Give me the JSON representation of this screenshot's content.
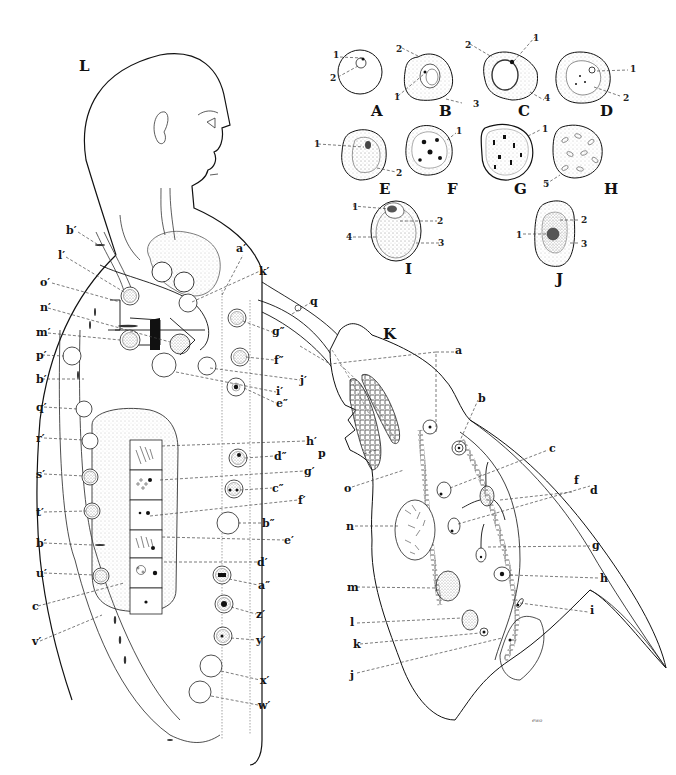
{
  "figure": {
    "panels": {
      "L": "L",
      "K": "K",
      "A": "A",
      "B": "B",
      "C": "C",
      "D": "D",
      "E": "E",
      "F": "F",
      "G": "G",
      "H": "H",
      "I": "I",
      "J": "J"
    },
    "signature": "ewo",
    "colors": {
      "ink": "#111111",
      "stipple": "#9a9a9a",
      "fill_gray": "#e6e6e6",
      "background": "#ffffff"
    }
  },
  "cell_panels": [
    {
      "id": "A",
      "numbered_parts": [
        "1",
        "2"
      ]
    },
    {
      "id": "B",
      "numbered_parts": [
        "1",
        "2",
        "3"
      ]
    },
    {
      "id": "C",
      "numbered_parts": [
        "1",
        "2",
        "4"
      ]
    },
    {
      "id": "D",
      "numbered_parts": [
        "1",
        "2"
      ]
    },
    {
      "id": "E",
      "numbered_parts": [
        "1",
        "2"
      ]
    },
    {
      "id": "F",
      "numbered_parts": [
        "1"
      ]
    },
    {
      "id": "G",
      "numbered_parts": [
        "1"
      ]
    },
    {
      "id": "H",
      "numbered_parts": [
        "5"
      ]
    },
    {
      "id": "I",
      "numbered_parts": [
        "1",
        "2",
        "3",
        "4"
      ]
    },
    {
      "id": "J",
      "numbered_parts": [
        "1",
        "2",
        "3"
      ]
    }
  ],
  "body_labels_left": [
    "b′",
    "l′",
    "o′",
    "n′",
    "m′",
    "p′",
    "b′",
    "q′",
    "r′",
    "s′",
    "t′",
    "b′",
    "u′",
    "c",
    "v′"
  ],
  "body_labels_right": [
    "a′",
    "k′",
    "q",
    "g″",
    "j′",
    "f″",
    "i′",
    "e″",
    "h′",
    "d″",
    "g′",
    "c″",
    "f′",
    "b″",
    "e′",
    "d′",
    "a″",
    "z′",
    "y′",
    "x′",
    "w′"
  ],
  "k_labels": [
    "a",
    "b",
    "c",
    "f",
    "d",
    "g",
    "h",
    "i",
    "p",
    "o",
    "n",
    "m",
    "l",
    "k",
    "j"
  ],
  "labels": {
    "L": "L",
    "K": "K",
    "bp1": "b′",
    "lp": "l′",
    "op": "o′",
    "np": "n′",
    "mp": "m′",
    "pp": "p′",
    "bp2": "b′",
    "qp": "q′",
    "rp": "r′",
    "sp": "s′",
    "tp": "t′",
    "bp3": "b′",
    "up": "u′",
    "c_left": "c",
    "vp": "v′",
    "ap": "a′",
    "kp": "k′",
    "q": "q",
    "gpp": "g″",
    "jp": "j′",
    "fpp": "f″",
    "ip": "i′",
    "epp": "e″",
    "hp": "h′",
    "dpp": "d″",
    "gp": "g′",
    "cpp": "c″",
    "fp": "f′",
    "bpp": "b″",
    "ep": "e′",
    "dp": "d′",
    "app": "a″",
    "zp": "z′",
    "yp": "y′",
    "xp": "x′",
    "wp": "w′",
    "a": "a",
    "b": "b",
    "c": "c",
    "f": "f",
    "d": "d",
    "g": "g",
    "h": "h",
    "i": "i",
    "p": "p",
    "o": "o",
    "n": "n",
    "m": "m",
    "l": "l",
    "k": "k",
    "j": "j",
    "n1": "1",
    "n2": "2",
    "n3": "3",
    "n4": "4",
    "n5": "5"
  }
}
